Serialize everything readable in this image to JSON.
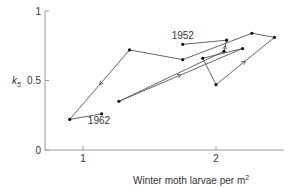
{
  "chart_data": {
    "type": "line",
    "title": "",
    "xlabel": "Winter moth larvae per m",
    "xlabel_superscript": "2",
    "ylabel": "k",
    "ylabel_subscript": "5",
    "xlim": [
      0.71,
      2.5
    ],
    "ylim": [
      0,
      1
    ],
    "xticks": [
      1,
      2
    ],
    "yticks": [
      0,
      0.5,
      1
    ],
    "xtick_labels": [
      "1",
      "2"
    ],
    "ytick_labels": [
      "0",
      "0.5",
      "1"
    ],
    "grid": false,
    "legend": null,
    "annotations": [
      {
        "text": "1952",
        "x": 1.75,
        "y": 0.76
      },
      {
        "text": "1962",
        "x": 1.12,
        "y": 0.2
      }
    ],
    "series": [
      {
        "name": "Winter moth k5 trajectory 1952-1962",
        "x": [
          1.75,
          2.08,
          2.06,
          1.27,
          2.2,
          1.9,
          2.0,
          2.44,
          2.27,
          1.75,
          1.35,
          0.9,
          1.14
        ],
        "y": [
          0.76,
          0.79,
          0.71,
          0.35,
          0.73,
          0.66,
          0.47,
          0.81,
          0.84,
          0.65,
          0.72,
          0.22,
          0.26
        ]
      }
    ],
    "arrows": [
      {
        "from_index": 3,
        "to_index": 4
      },
      {
        "from_index": 6,
        "to_index": 7
      },
      {
        "from_index": 10,
        "to_index": 11
      },
      {
        "from_index": 2,
        "to_index": 1
      }
    ]
  }
}
